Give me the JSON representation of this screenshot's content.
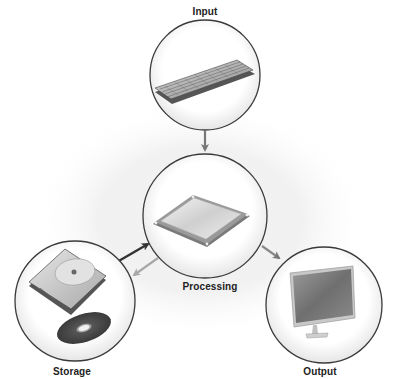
{
  "diagram": {
    "nodes": [
      {
        "id": "input",
        "label": "Input",
        "icon": "keyboard-icon"
      },
      {
        "id": "processing",
        "label": "Processing",
        "icon": "cpu-chip-icon"
      },
      {
        "id": "storage",
        "label": "Storage",
        "icon": "hard-drive-and-disc-icon"
      },
      {
        "id": "output",
        "label": "Output",
        "icon": "monitor-icon"
      }
    ],
    "edges": [
      {
        "from": "input",
        "to": "processing",
        "style": "gray arrow"
      },
      {
        "from": "storage",
        "to": "processing",
        "style": "dark arrow"
      },
      {
        "from": "processing",
        "to": "storage",
        "style": "light gray arrow"
      },
      {
        "from": "processing",
        "to": "output",
        "style": "gray arrow"
      }
    ],
    "colors": {
      "circle_border": "#3a3a3a",
      "arrow_dark": "#333333",
      "arrow_gray": "#777777",
      "arrow_light": "#aaaaaa",
      "label_text": "#222222"
    }
  }
}
